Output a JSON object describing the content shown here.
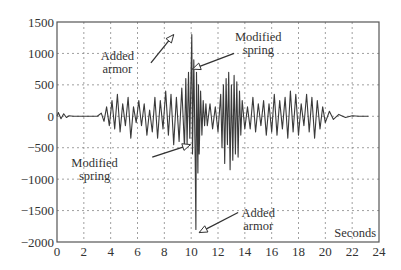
{
  "chart_data": {
    "type": "line",
    "title": "",
    "xlabel": "Seconds",
    "ylabel": "",
    "xlim": [
      0,
      24
    ],
    "ylim": [
      -2000,
      1500
    ],
    "grid": true,
    "legend": null,
    "x_ticks": [
      0,
      2,
      4,
      6,
      8,
      10,
      12,
      14,
      16,
      18,
      20,
      22,
      24
    ],
    "y_ticks": [
      1500,
      1000,
      500,
      0,
      -500,
      -1000,
      -1500,
      -2000
    ],
    "x_tick_labels": [
      "0",
      "2",
      "4",
      "6",
      "8",
      "10",
      "12",
      "14",
      "16",
      "18",
      "20",
      "22",
      "24"
    ],
    "y_tick_labels": [
      "1500",
      "1000",
      "500",
      "0",
      "−500",
      "−1000",
      "−1500",
      "−2000"
    ],
    "series": [
      {
        "name": "response",
        "x": [
          0,
          0.1,
          0.3,
          0.5,
          0.7,
          0.9,
          1.2,
          1.5,
          2,
          2.5,
          3,
          3.3,
          3.5,
          3.7,
          3.9,
          4.1,
          4.3,
          4.5,
          4.7,
          4.9,
          5.1,
          5.3,
          5.5,
          5.7,
          5.9,
          6.1,
          6.3,
          6.5,
          6.7,
          6.9,
          7.1,
          7.3,
          7.5,
          7.7,
          7.9,
          8.1,
          8.3,
          8.5,
          8.7,
          8.9,
          9.1,
          9.3,
          9.5,
          9.6,
          9.7,
          9.8,
          9.9,
          10.0,
          10.05,
          10.1,
          10.2,
          10.3,
          10.35,
          10.4,
          10.5,
          10.55,
          10.6,
          10.7,
          10.8,
          10.9,
          11.0,
          11.1,
          11.2,
          11.4,
          11.6,
          11.8,
          12.0,
          12.2,
          12.3,
          12.4,
          12.5,
          12.6,
          12.7,
          12.8,
          12.9,
          13.0,
          13.1,
          13.2,
          13.3,
          13.4,
          13.5,
          13.6,
          13.7,
          13.8,
          14.0,
          14.2,
          14.4,
          14.6,
          14.8,
          15.0,
          15.2,
          15.4,
          15.6,
          15.8,
          16.0,
          16.2,
          16.4,
          16.6,
          16.8,
          17.0,
          17.2,
          17.4,
          17.6,
          17.8,
          18.0,
          18.2,
          18.4,
          18.6,
          18.8,
          19.0,
          19.2,
          19.4,
          19.6,
          19.8,
          20.0,
          20.3,
          20.6,
          21.0,
          21.5,
          22,
          22.5,
          23.2
        ],
        "y": [
          0,
          60,
          -40,
          40,
          -20,
          10,
          0,
          0,
          0,
          0,
          0,
          50,
          -80,
          150,
          -150,
          250,
          -200,
          350,
          -250,
          200,
          -150,
          300,
          -350,
          150,
          -100,
          250,
          -150,
          200,
          -300,
          100,
          -250,
          300,
          -350,
          250,
          -200,
          400,
          -300,
          350,
          -450,
          300,
          -400,
          450,
          -500,
          600,
          -450,
          700,
          -350,
          800,
          1300,
          -600,
          900,
          -700,
          -1800,
          700,
          -900,
          500,
          -600,
          400,
          -300,
          250,
          -150,
          200,
          -150,
          200,
          -200,
          150,
          -250,
          350,
          -500,
          500,
          -750,
          600,
          -450,
          700,
          -850,
          500,
          -700,
          650,
          -600,
          550,
          -650,
          400,
          -300,
          250,
          -200,
          150,
          -200,
          300,
          -250,
          200,
          -150,
          250,
          -300,
          200,
          -250,
          350,
          -300,
          250,
          -200,
          300,
          -350,
          400,
          -250,
          350,
          -300,
          200,
          -150,
          350,
          -250,
          300,
          -350,
          250,
          -200,
          150,
          -100,
          80,
          -50,
          30,
          -20,
          10,
          0,
          0
        ]
      }
    ],
    "annotations": [
      {
        "text": [
          "Added",
          "armor"
        ],
        "x": 4.5,
        "y": 900,
        "arrow_to": [
          8.7,
          1300
        ],
        "arrow_from": [
          7.0,
          850
        ]
      },
      {
        "text": [
          "Modified",
          "spring"
        ],
        "x": 15.0,
        "y": 1200,
        "arrow_to": [
          10.1,
          750
        ],
        "arrow_from": [
          13.2,
          1000
        ]
      },
      {
        "text": [
          "Modified",
          "spring"
        ],
        "x": 2.8,
        "y": -800,
        "arrow_to": [
          9.95,
          -450
        ],
        "arrow_from": [
          7.1,
          -650
        ]
      },
      {
        "text": [
          "Added",
          "armor"
        ],
        "x": 15.0,
        "y": -1600,
        "arrow_to": [
          10.6,
          -1850
        ],
        "arrow_from": [
          13.5,
          -1530
        ]
      }
    ]
  }
}
